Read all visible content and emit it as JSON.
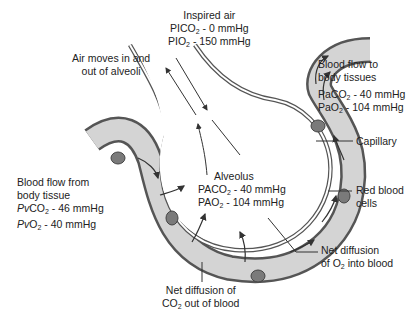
{
  "inspired_air": {
    "title": "Inspired air",
    "pico2": {
      "prefix": "PICO",
      "sub": "2",
      "value": " - 0 mmHg"
    },
    "pio2": {
      "prefix": "PIO",
      "sub": "2",
      "value": " - 150 mmHg"
    }
  },
  "air_moves": {
    "line1": "Air moves in and",
    "line2": "out of alveoli"
  },
  "blood_to_tissues": {
    "line1": "Blood flow to",
    "line2": "body tissues",
    "paco2": {
      "prefix": "PaCO",
      "sub": "2",
      "value": " - 40 mmHg"
    },
    "pao2": {
      "prefix": "PaO",
      "sub": "2",
      "value": " - 104 mmHg"
    }
  },
  "capillary": {
    "label": "Capillary"
  },
  "red_blood_cells": {
    "line1": "Red blood",
    "line2": "cells"
  },
  "blood_from_tissue": {
    "line1": "Blood flow from",
    "line2": "body tissue",
    "pvco2": {
      "p": "P",
      "v": "v",
      "rest": "CO",
      "sub": "2",
      "value": " - 46 mmHg"
    },
    "pvo2": {
      "p": "P",
      "v": "v",
      "rest": "O",
      "sub": "2",
      "value": " - 40 mmHg"
    }
  },
  "alveolus": {
    "label": "Alveolus",
    "paco2": {
      "prefix": "PACO",
      "sub": "2",
      "value": " - 40 mmHg"
    },
    "pao2": {
      "prefix": "PAO",
      "sub": "2",
      "value": " - 104 mmHg"
    }
  },
  "o2_diffusion": {
    "line1": "Net diffusion",
    "line2_pre": "of O",
    "line2_sub": "2",
    "line2_post": " into blood"
  },
  "co2_diffusion": {
    "line1": "Net diffusion of",
    "line2_pre": "CO",
    "line2_sub": "2",
    "line2_post": " out of blood"
  },
  "colors": {
    "capillary_fill": "#d4d4d4",
    "capillary_wall": "#555555",
    "rbc_fill": "#7a7a7a",
    "line": "#333333"
  }
}
